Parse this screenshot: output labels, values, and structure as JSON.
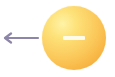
{
  "diagram": {
    "charge": {
      "sign": "−",
      "label": "negative charge",
      "fill_color": "#fbc85a",
      "highlight_color": "#fff3a6",
      "sign_color": "#fffbea"
    },
    "arrow": {
      "direction": "left",
      "label": "direction arrow",
      "color": "#8e86a8"
    }
  }
}
